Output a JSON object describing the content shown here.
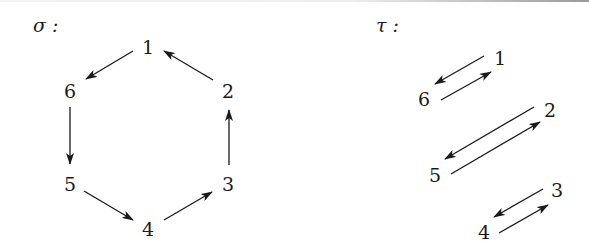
{
  "diagrams": [
    {
      "id": "sigma",
      "title": "σ :",
      "nodes": [
        {
          "label": "1",
          "x": 148,
          "y": 53
        },
        {
          "label": "2",
          "x": 229,
          "y": 96
        },
        {
          "label": "3",
          "x": 229,
          "y": 189
        },
        {
          "label": "4",
          "x": 148,
          "y": 235
        },
        {
          "label": "5",
          "x": 70,
          "y": 189
        },
        {
          "label": "6",
          "x": 70,
          "y": 96
        }
      ],
      "edges": [
        {
          "from": "1",
          "to": "6"
        },
        {
          "from": "6",
          "to": "5"
        },
        {
          "from": "5",
          "to": "4"
        },
        {
          "from": "4",
          "to": "3"
        },
        {
          "from": "3",
          "to": "2"
        },
        {
          "from": "2",
          "to": "1"
        }
      ]
    },
    {
      "id": "tau",
      "title": "τ :",
      "nodes": [
        {
          "label": "1",
          "x": 499,
          "y": 65
        },
        {
          "label": "6",
          "x": 424,
          "y": 105
        },
        {
          "label": "2",
          "x": 549,
          "y": 117
        },
        {
          "label": "5",
          "x": 434,
          "y": 181
        },
        {
          "label": "3",
          "x": 557,
          "y": 197
        },
        {
          "label": "4",
          "x": 483,
          "y": 238
        }
      ],
      "edges": [
        {
          "from": "1",
          "to": "6"
        },
        {
          "from": "6",
          "to": "1"
        },
        {
          "from": "2",
          "to": "5"
        },
        {
          "from": "5",
          "to": "2"
        },
        {
          "from": "3",
          "to": "4"
        },
        {
          "from": "4",
          "to": "3"
        }
      ]
    }
  ],
  "sigma_title": "σ :",
  "tau_title": "τ :",
  "sigma_labels": {
    "n1": "1",
    "n2": "2",
    "n3": "3",
    "n4": "4",
    "n5": "5",
    "n6": "6"
  },
  "tau_labels": {
    "n1": "1",
    "n2": "2",
    "n3": "3",
    "n4": "4",
    "n5": "5",
    "n6": "6"
  }
}
